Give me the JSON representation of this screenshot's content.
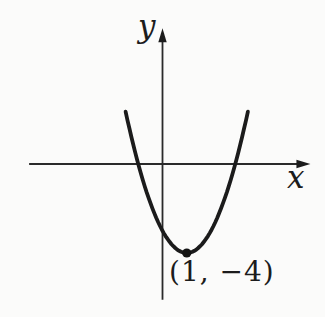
{
  "figure": {
    "background": "#fbfbfa",
    "ink_color": "#1c1c1c"
  },
  "labels": {
    "y_axis": "y",
    "x_axis": "x",
    "vertex": "(1, −4)"
  },
  "chart_data": {
    "type": "line",
    "title": "",
    "curve": "upward-opening parabola",
    "equation": "y = (x − 1)² − 4",
    "leading_coefficient": 1,
    "vertex": {
      "x": 1,
      "y": -4
    },
    "x_intercepts": [
      -1,
      3
    ],
    "y_intercept": -3,
    "marked_points": [
      {
        "x": 1,
        "y": -4,
        "label": "(1, −4)"
      }
    ],
    "xlabel": "x",
    "ylabel": "y",
    "axis_x_range": [
      -5.5,
      6.1
    ],
    "axis_y_range": [
      -6.1,
      6.1
    ],
    "plotted_x_range": [
      -1.52,
      3.52
    ],
    "grid": false,
    "tick_labels": "none",
    "legend": "none"
  }
}
